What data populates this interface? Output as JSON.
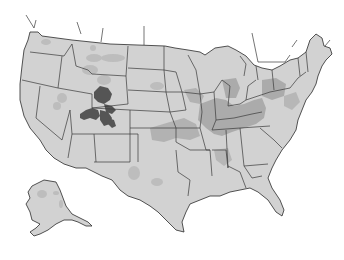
{
  "map": {
    "subject": "United States",
    "colors": {
      "background": "#ffffff",
      "land": "#d2d2d2",
      "stroke": "#2a2a2a",
      "medium_shade": "#a9a9a9",
      "light_shade": "#bdbdbd",
      "dark_shade": "#555555"
    },
    "regions": [
      {
        "name": "contiguous-us",
        "shade": "land"
      },
      {
        "name": "alaska",
        "shade": "land"
      },
      {
        "name": "wyoming-colorado-utah-cluster",
        "shade": "dark_shade"
      },
      {
        "name": "midwest-ohio-valley",
        "shade": "medium_shade"
      },
      {
        "name": "scattered-west-patches",
        "shade": "light_shade"
      },
      {
        "name": "texas-patches",
        "shade": "light_shade"
      }
    ]
  }
}
